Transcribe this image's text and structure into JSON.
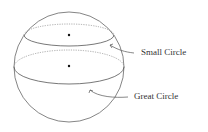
{
  "diagram": {
    "title": "",
    "labels": {
      "small_circle": "Small Circle",
      "great_circle": "Great Circle"
    },
    "colors": {
      "line": "#555555",
      "dot": "#111111",
      "text": "#333333"
    }
  }
}
